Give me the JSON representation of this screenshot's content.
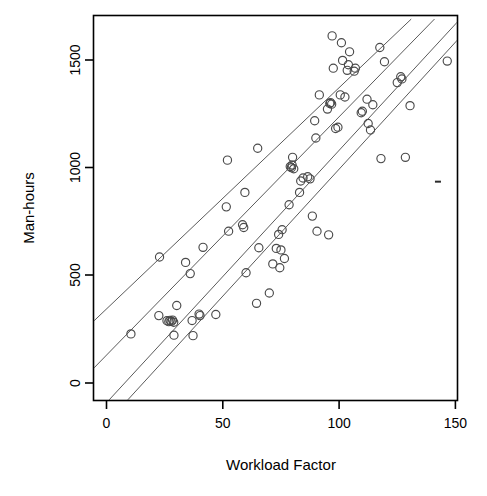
{
  "chart_data": {
    "type": "scatter",
    "title": "",
    "xlabel": "Workload Factor",
    "ylabel": "Man-hours",
    "xlim": [
      -7,
      157
    ],
    "ylim": [
      -80,
      1690
    ],
    "xticks": [
      0,
      50,
      100,
      150
    ],
    "xtick_labels": [
      "0",
      "50",
      "100",
      "150"
    ],
    "yticks": [
      0,
      500,
      1000,
      1500
    ],
    "ytick_labels": [
      "0",
      "500",
      "1000",
      "1500"
    ],
    "grid": false,
    "legend": "none",
    "marker": "open-circle",
    "points": [
      {
        "x": 10.5,
        "y": 228
      },
      {
        "x": 22.5,
        "y": 313
      },
      {
        "x": 22.8,
        "y": 585
      },
      {
        "x": 26.0,
        "y": 289
      },
      {
        "x": 26.8,
        "y": 285
      },
      {
        "x": 27.3,
        "y": 291
      },
      {
        "x": 27.8,
        "y": 286
      },
      {
        "x": 28.4,
        "y": 292
      },
      {
        "x": 28.9,
        "y": 282
      },
      {
        "x": 29.0,
        "y": 222
      },
      {
        "x": 30.2,
        "y": 360
      },
      {
        "x": 34.0,
        "y": 560
      },
      {
        "x": 36.0,
        "y": 508
      },
      {
        "x": 36.8,
        "y": 290
      },
      {
        "x": 37.2,
        "y": 220
      },
      {
        "x": 39.8,
        "y": 320
      },
      {
        "x": 40.2,
        "y": 313
      },
      {
        "x": 41.5,
        "y": 630
      },
      {
        "x": 47.0,
        "y": 318
      },
      {
        "x": 51.5,
        "y": 818
      },
      {
        "x": 52.0,
        "y": 1035
      },
      {
        "x": 52.5,
        "y": 705
      },
      {
        "x": 58.5,
        "y": 735
      },
      {
        "x": 59.0,
        "y": 722
      },
      {
        "x": 59.5,
        "y": 885
      },
      {
        "x": 60.0,
        "y": 512
      },
      {
        "x": 64.5,
        "y": 370
      },
      {
        "x": 65.0,
        "y": 1090
      },
      {
        "x": 65.5,
        "y": 628
      },
      {
        "x": 70.0,
        "y": 418
      },
      {
        "x": 71.5,
        "y": 553
      },
      {
        "x": 73.0,
        "y": 625
      },
      {
        "x": 74.0,
        "y": 690
      },
      {
        "x": 74.5,
        "y": 535
      },
      {
        "x": 75.0,
        "y": 618
      },
      {
        "x": 75.5,
        "y": 712
      },
      {
        "x": 76.5,
        "y": 578
      },
      {
        "x": 78.5,
        "y": 828
      },
      {
        "x": 79.0,
        "y": 1005
      },
      {
        "x": 79.5,
        "y": 1000
      },
      {
        "x": 79.8,
        "y": 1012
      },
      {
        "x": 80.0,
        "y": 1048
      },
      {
        "x": 80.5,
        "y": 995
      },
      {
        "x": 83.0,
        "y": 885
      },
      {
        "x": 83.5,
        "y": 938
      },
      {
        "x": 84.5,
        "y": 952
      },
      {
        "x": 86.5,
        "y": 958
      },
      {
        "x": 87.5,
        "y": 948
      },
      {
        "x": 88.5,
        "y": 775
      },
      {
        "x": 89.5,
        "y": 1218
      },
      {
        "x": 90.0,
        "y": 1138
      },
      {
        "x": 90.5,
        "y": 705
      },
      {
        "x": 91.5,
        "y": 1338
      },
      {
        "x": 95.0,
        "y": 1272
      },
      {
        "x": 95.5,
        "y": 688
      },
      {
        "x": 96.0,
        "y": 1298
      },
      {
        "x": 96.3,
        "y": 1302
      },
      {
        "x": 96.8,
        "y": 1295
      },
      {
        "x": 97.0,
        "y": 1612
      },
      {
        "x": 97.5,
        "y": 1462
      },
      {
        "x": 98.5,
        "y": 1182
      },
      {
        "x": 99.5,
        "y": 1188
      },
      {
        "x": 100.5,
        "y": 1338
      },
      {
        "x": 101.0,
        "y": 1580
      },
      {
        "x": 101.5,
        "y": 1498
      },
      {
        "x": 102.5,
        "y": 1328
      },
      {
        "x": 103.5,
        "y": 1452
      },
      {
        "x": 104.0,
        "y": 1478
      },
      {
        "x": 104.5,
        "y": 1538
      },
      {
        "x": 106.5,
        "y": 1448
      },
      {
        "x": 107.0,
        "y": 1462
      },
      {
        "x": 109.5,
        "y": 1255
      },
      {
        "x": 110.0,
        "y": 1262
      },
      {
        "x": 112.0,
        "y": 1318
      },
      {
        "x": 112.5,
        "y": 1205
      },
      {
        "x": 113.5,
        "y": 1175
      },
      {
        "x": 114.5,
        "y": 1292
      },
      {
        "x": 117.5,
        "y": 1558
      },
      {
        "x": 118.0,
        "y": 1042
      },
      {
        "x": 119.5,
        "y": 1492
      },
      {
        "x": 125.0,
        "y": 1395
      },
      {
        "x": 126.5,
        "y": 1422
      },
      {
        "x": 127.0,
        "y": 1412
      },
      {
        "x": 128.5,
        "y": 1048
      },
      {
        "x": 130.5,
        "y": 1288
      },
      {
        "x": 146.5,
        "y": 1495
      }
    ],
    "fit_lines": [
      {
        "name": "fit-line-1",
        "x1": -7,
        "y1": 272,
        "x2": 131,
        "y2": 1690
      },
      {
        "name": "fit-line-2",
        "x1": -7,
        "y1": 52,
        "x2": 141,
        "y2": 1690
      },
      {
        "name": "fit-line-3",
        "x1": 1,
        "y1": -80,
        "x2": 152,
        "y2": 1690
      },
      {
        "name": "fit-line-4",
        "x1": 9,
        "y1": -80,
        "x2": 157,
        "y2": 1665
      }
    ],
    "stray_mark": {
      "x": 142.5,
      "y": 935
    }
  }
}
